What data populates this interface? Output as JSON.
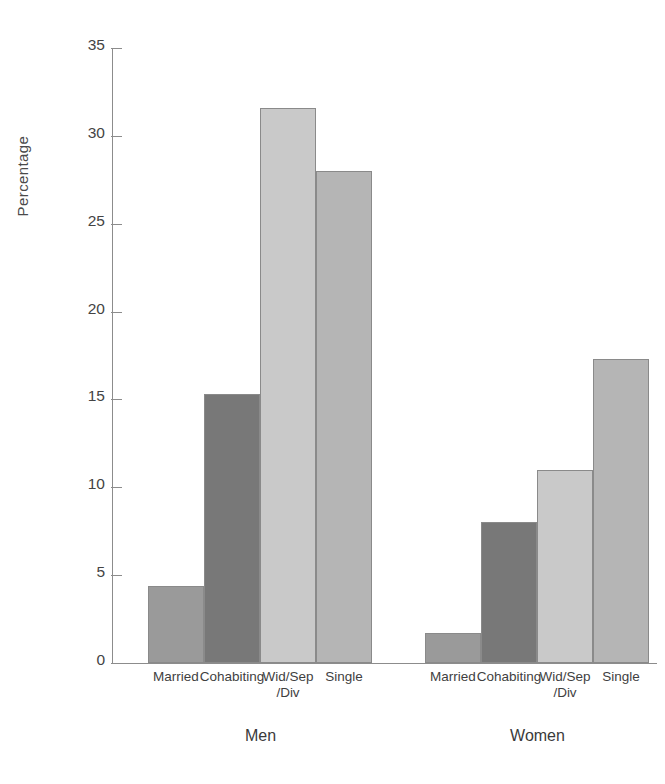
{
  "chart_data": {
    "type": "bar",
    "title": "",
    "xlabel": "",
    "ylabel": "Percentage",
    "ylim": [
      0,
      35
    ],
    "yticks": [
      0,
      5,
      10,
      15,
      20,
      25,
      30,
      35
    ],
    "ytick_labels": [
      "0",
      "5",
      "10",
      "15",
      "20",
      "25",
      "30",
      "35"
    ],
    "grid": false,
    "legend": "none",
    "categories": [
      "Married",
      "Cohabiting",
      "Wid/Sep\n/Div",
      "Single"
    ],
    "groups": [
      {
        "name": "Men",
        "values": [
          4.4,
          15.3,
          31.6,
          28.0
        ]
      },
      {
        "name": "Women",
        "values": [
          1.7,
          8.0,
          11.0,
          17.3
        ]
      }
    ],
    "bar_colors": [
      "#9a9a9a",
      "#787878",
      "#c9c9c9",
      "#b5b5b5"
    ],
    "bar_edge_color": "#8a8a8a",
    "axis_color": "#8c8c8c",
    "background": "#ffffff"
  }
}
